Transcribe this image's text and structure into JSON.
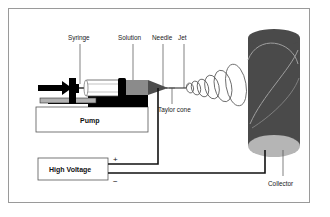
{
  "figure": {
    "border_color": "#9a9a9a",
    "background": "#ffffff"
  },
  "labels": {
    "syringe": "Syringe",
    "solution": "Solution",
    "needle": "Needle",
    "jet": "Jet",
    "taylor_cone": "Taylor cone",
    "collector": "Collector",
    "pump": "Pump",
    "high_voltage": "High Voltage",
    "plus": "+",
    "minus": "−"
  },
  "components": {
    "pump_box": {
      "label": "Pump",
      "fill": "#ffffff",
      "stroke": "#555555"
    },
    "high_voltage_box": {
      "label": "High Voltage",
      "fill": "#ffffff",
      "stroke": "#555555"
    },
    "syringe_body": {
      "fill": "#ffffff",
      "stroke": "#4a4a4a"
    },
    "solution_region": {
      "fill": "#8b8b8b"
    },
    "needle_tip": {
      "fill": "#4d4d4d"
    },
    "plunger": {
      "fill": "#000000"
    },
    "drive_arrow": {
      "fill": "#000000"
    },
    "stage_block": {
      "fill": "#000000"
    },
    "collector_drum": {
      "fill": "#4a4a4a"
    },
    "collector_face": {
      "fill": "#b5b5b5"
    }
  },
  "icons": {
    "arrow": "drive-arrow-icon",
    "jet": "whipping-jet-icon",
    "drum": "collector-drum-icon"
  },
  "colors": {
    "ink": "#111111",
    "line": "#555555",
    "grey_mid": "#8b8b8b",
    "grey_dark": "#4a4a4a",
    "grey_light": "#b5b5b5"
  }
}
